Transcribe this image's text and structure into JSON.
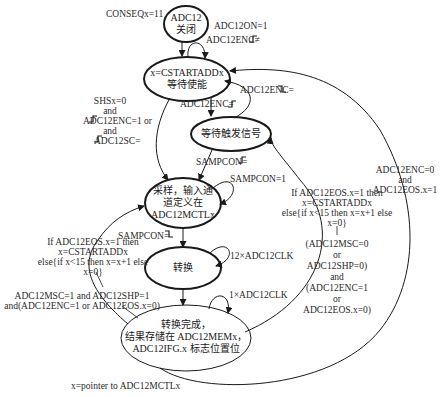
{
  "diagram": {
    "type": "state-machine",
    "states": [
      {
        "id": "off",
        "lines": [
          "ADC12",
          "关闭"
        ]
      },
      {
        "id": "wait_enable",
        "lines": [
          "x=CSTARTADDx",
          "等待使能"
        ]
      },
      {
        "id": "wait_trigger",
        "lines": [
          "等待触发信号"
        ]
      },
      {
        "id": "sample",
        "lines": [
          "采样，输入通",
          "道定义在",
          "ADC12MCTLx"
        ]
      },
      {
        "id": "convert",
        "lines": [
          "转换"
        ]
      },
      {
        "id": "done",
        "lines": [
          "转换完成，",
          "结果存储在 ADC12MEMx，",
          "ADC12IFG.x 标志位置位"
        ]
      }
    ],
    "labels": {
      "conseq": "CONSEQx=11",
      "adc12on": "ADC12ON=1",
      "enc_not_rise": "ADC12ENC≠",
      "enc_rise": "ADC12ENC=",
      "enc_fall": "ADC12ENC=",
      "shs_1": "SHSx=0",
      "shs_2": "and",
      "shs_3": "ADC12ENC=1 or",
      "shs_4": "and",
      "shs_5": "ADC12SC=",
      "sampcon_rise": "SAMPCON=",
      "sampcon_1": "SAMPCON=1",
      "sampcon_fall": "SAMPCON=",
      "clk12": "12×ADC12CLK",
      "clk1": "1×ADC12CLK",
      "eos_left_1": "If ADC12EOS.x=1 then",
      "eos_left_2": "x=CSTARTADDx",
      "eos_left_3": "else{if x<15 then x=x+1 else",
      "eos_left_4": "x=0}",
      "msc_left_1": "ADC12MSC=1 and ADC12SHP=1",
      "msc_left_2": "and(ADC12ENC=1 or ADC12EOS.x=0)",
      "eos_mid_1": "If ADC12EOS.x=1 then",
      "eos_mid_2": "x=CSTARTADDx",
      "eos_mid_3": "else{if x<15 then x=x+1 else",
      "eos_mid_4": "x=0}",
      "msc_mid_1": "(ADC12MSC=0",
      "msc_mid_2": "or",
      "msc_mid_3": "ADC12SHP=0)",
      "msc_mid_4": "and",
      "msc_mid_5": "(ADC12ENC=1",
      "msc_mid_6": "or",
      "msc_mid_7": "ADC12EOS.x=0)",
      "enc0_1": "ADC12ENC=0",
      "enc0_2": "and",
      "enc0_3": "ADC12EOS.x=1",
      "footnote": "x=pointer to ADC12MCTLx"
    },
    "colors": {
      "background": "#ffffff",
      "stroke": "#1a1a1a",
      "text": "#222222"
    }
  }
}
